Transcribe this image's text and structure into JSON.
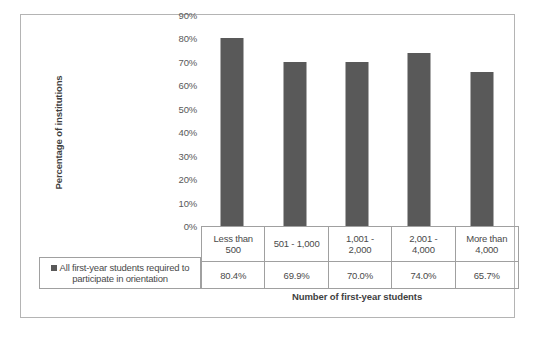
{
  "chart_data": {
    "type": "bar",
    "title": "",
    "categories": [
      "Less than 500",
      "501 - 1,000",
      "1,001 - 2,000",
      "2,001 - 4,000",
      "More than 4,000"
    ],
    "category_lines": [
      [
        "Less than",
        "500"
      ],
      [
        "501 - 1,000",
        ""
      ],
      [
        "1,001 -",
        "2,000"
      ],
      [
        "2,001 -",
        "4,000"
      ],
      [
        "More than",
        "4,000"
      ]
    ],
    "values": [
      80.4,
      69.9,
      70.0,
      74.0,
      65.7
    ],
    "value_labels": [
      "80.4%",
      "69.9%",
      "70.0%",
      "74.0%",
      "65.7%"
    ],
    "series": [
      {
        "name": "All first-year students required to participate in orientation",
        "values": [
          80.4,
          69.9,
          70.0,
          74.0,
          65.7
        ]
      }
    ],
    "xlabel": "Number of first-year students",
    "ylabel": "Percentage of institutions",
    "ylim": [
      0,
      90
    ],
    "ytick_values": [
      90,
      80,
      70,
      60,
      50,
      40,
      30,
      20,
      10,
      0
    ],
    "ytick_labels": [
      "90%",
      "80%",
      "70%",
      "60%",
      "50%",
      "40%",
      "30%",
      "20%",
      "10%",
      "0%"
    ],
    "grid": false,
    "legend_position": "left-of-data-table",
    "bar_color": "#595959",
    "frame_color": "#b4b4b4"
  },
  "legend": {
    "line1": "All first-year students required to",
    "line2": "participate in orientation"
  }
}
